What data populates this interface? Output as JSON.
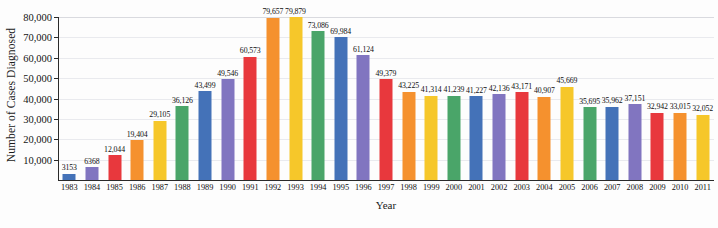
{
  "chart_data": {
    "type": "bar",
    "title": "",
    "xlabel": "Year",
    "ylabel": "Number of Cases Diagnosed",
    "ylim": [
      0,
      80000
    ],
    "grid": true,
    "legend": "none",
    "ytick_labels": [
      "10,000",
      "20,000",
      "30,000",
      "40,000",
      "50,000",
      "60,000",
      "70,000",
      "80,000"
    ],
    "ytick_values": [
      10000,
      20000,
      30000,
      40000,
      50000,
      60000,
      70000,
      80000
    ],
    "categories": [
      "1983",
      "1984",
      "1985",
      "1986",
      "1987",
      "1988",
      "1989",
      "1990",
      "1991",
      "1992",
      "1993",
      "1994",
      "1995",
      "1996",
      "1997",
      "1998",
      "1999",
      "2000",
      "2001",
      "2002",
      "2003",
      "2004",
      "2005",
      "2006",
      "2007",
      "2008",
      "2009",
      "2010",
      "2011"
    ],
    "values": [
      3153,
      6368,
      12044,
      19404,
      29105,
      36126,
      43499,
      49546,
      60573,
      79657,
      79879,
      73086,
      69984,
      61124,
      49379,
      43225,
      41314,
      41239,
      41227,
      42136,
      43171,
      40907,
      45669,
      35695,
      35962,
      37151,
      32942,
      33015,
      32052
    ],
    "value_labels": [
      "3153",
      "6368",
      "12,044",
      "19,404",
      "29,105",
      "36,126",
      "43,499",
      "49,546",
      "60,573",
      "79,657",
      "79,879",
      "73,086",
      "69,984",
      "61,124",
      "49,379",
      "43,225",
      "41,314",
      "41,239",
      "41,227",
      "42,136",
      "43,171",
      "40,907",
      "45,669",
      "35,695",
      "35,962",
      "37,151",
      "32,942",
      "33,015",
      "32,052"
    ],
    "bar_colors": [
      "#4472b8",
      "#8175c0",
      "#e8383d",
      "#f5912e",
      "#f6c72a",
      "#4aa569",
      "#4472b8",
      "#8175c0",
      "#e8383d",
      "#f5912e",
      "#f6c72a",
      "#4aa569",
      "#4472b8",
      "#8175c0",
      "#e8383d",
      "#f5912e",
      "#f6c72a",
      "#4aa569",
      "#4472b8",
      "#8175c0",
      "#e8383d",
      "#f5912e",
      "#f6c72a",
      "#4aa569",
      "#4472b8",
      "#8175c0",
      "#e8383d",
      "#f5912e",
      "#f6c72a"
    ],
    "palette_cycle": [
      "#4472b8",
      "#8175c0",
      "#e8383d",
      "#f5912e",
      "#f6c72a",
      "#4aa569"
    ],
    "gridline_color": "#e9eaee",
    "axis_color": "#2a2a2a",
    "background_color": "#fdfdfd"
  }
}
